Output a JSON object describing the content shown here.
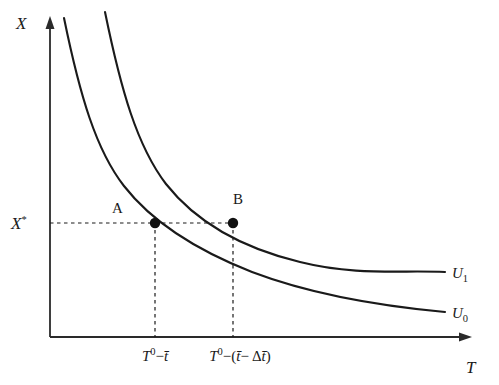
{
  "figure": {
    "type": "indifference-curve-diagram",
    "background_color": "#ffffff",
    "ink_color": "#1a1a1a",
    "axes": {
      "y_label": "X",
      "x_label": "T",
      "origin": {
        "x": 50,
        "y": 337
      },
      "y_top": {
        "x": 50,
        "y": 22
      },
      "x_right": {
        "x": 470,
        "y": 337
      }
    },
    "y_tick": {
      "label_base": "X",
      "label_sup": "*",
      "value_y": 223
    },
    "x_ticks": [
      {
        "id": "tick-a",
        "x": 155,
        "parts": [
          "T",
          "0",
          "−",
          "t̄"
        ],
        "text": "T⁰−t̄"
      },
      {
        "id": "tick-b",
        "x": 233,
        "parts": [
          "T",
          "0",
          "−",
          "(",
          "t̄",
          "−",
          "Δ",
          "t̄",
          ")"
        ],
        "text": "T⁰−(t̄− Δt̄)"
      }
    ],
    "curves": [
      {
        "id": "curve-u0",
        "label_base": "U",
        "label_sub": "0",
        "label_x": 452,
        "label_y": 318,
        "path": "M 64,18 C 80,96 96,150 124,186 C 152,222 196,250 252,272 C 310,294 380,306 445,312"
      },
      {
        "id": "curve-u1",
        "label_base": "U",
        "label_sub": "1",
        "label_x": 452,
        "label_y": 278,
        "path": "M 105,12 C 121,90 137,146 166,184 C 196,222 242,248 300,262 C 356,276 400,270 445,272"
      }
    ],
    "points": [
      {
        "id": "point-a",
        "label": "A",
        "x": 155,
        "y": 223,
        "label_x": 118,
        "label_y": 212
      },
      {
        "id": "point-b",
        "label": "B",
        "x": 233,
        "y": 223,
        "label_x": 238,
        "label_y": 203
      }
    ],
    "guides": {
      "horizontal_y": 223,
      "horizontal_x_start": 50,
      "horizontal_x_end": 233,
      "verticals": [
        {
          "x": 155,
          "y_start": 223,
          "y_end": 337
        },
        {
          "x": 233,
          "y_start": 223,
          "y_end": 337
        }
      ]
    }
  },
  "chart_data": {
    "type": "line",
    "title": "",
    "xlabel": "T",
    "ylabel": "X",
    "grid": false,
    "legend": "inline-right",
    "series": [
      {
        "name": "U₀",
        "description": "lower indifference curve",
        "points": [
          [
            64,
            18
          ],
          [
            124,
            186
          ],
          [
            155,
            223
          ],
          [
            252,
            272
          ],
          [
            445,
            312
          ]
        ]
      },
      {
        "name": "U₁",
        "description": "upper indifference curve",
        "points": [
          [
            105,
            12
          ],
          [
            166,
            184
          ],
          [
            233,
            223
          ],
          [
            300,
            262
          ],
          [
            445,
            272
          ]
        ]
      }
    ],
    "annotations": [
      {
        "label": "A",
        "series": "U₀",
        "x_tick": "T⁰−t̄",
        "y_tick": "X*"
      },
      {
        "label": "B",
        "series": "U₁",
        "x_tick": "T⁰−(t̄− Δt̄)",
        "y_tick": "X*"
      }
    ],
    "x_tick_labels": [
      "T⁰−t̄",
      "T⁰−(t̄− Δt̄)"
    ],
    "y_tick_labels": [
      "X*"
    ]
  }
}
